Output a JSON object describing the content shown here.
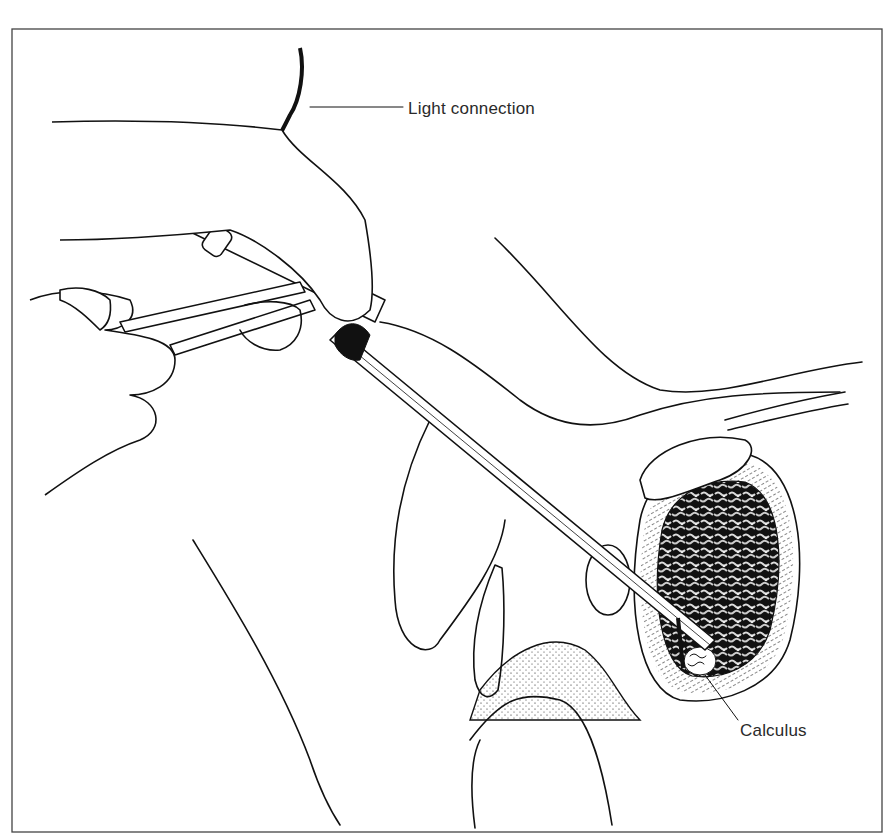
{
  "figure": {
    "labels": {
      "light_connection": "Light connection",
      "calculus": "Calculus"
    },
    "colors": {
      "ink": "#111111",
      "background": "#ffffff",
      "frame": "#444444",
      "label_text": "#2a2a2a"
    }
  }
}
